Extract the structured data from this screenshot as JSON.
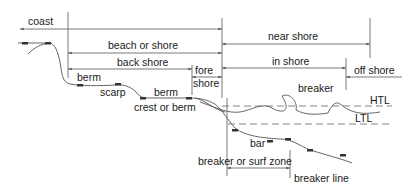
{
  "labels": {
    "coast": "coast",
    "beach_or_shore": "beach or shore",
    "near_shore": "near shore",
    "back_shore": "back shore",
    "fore_shore_line1": "fore",
    "fore_shore_line2": "shore",
    "in_shore": "in shore",
    "off_shore": "off shore",
    "berm_upper": "berm",
    "scarp": "scarp",
    "berm_lower": "berm",
    "crest_or_berm": "crest or berm",
    "breaker": "breaker",
    "htl": "HTL",
    "ltl": "LTL",
    "bar": "bar",
    "breaker_or_surf_zone": "breaker or surf zone",
    "breaker_line": "breaker line"
  },
  "colors": {
    "line": "#555555",
    "text": "#1a1a1a",
    "background": "#ffffff"
  }
}
